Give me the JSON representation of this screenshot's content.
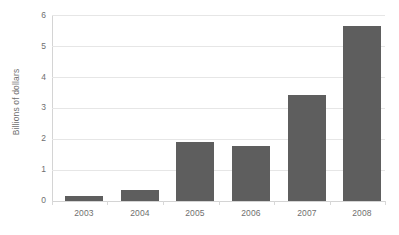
{
  "chart_data": {
    "type": "bar",
    "title": "",
    "subtitle": "",
    "xlabel": "",
    "ylabel": "Billions of dollars",
    "categories": [
      "2003",
      "2004",
      "2005",
      "2006",
      "2007",
      "2008"
    ],
    "values": [
      0.16,
      0.36,
      1.9,
      1.78,
      3.42,
      5.65
    ],
    "series": [
      {
        "name": "",
        "values": [
          0.16,
          0.36,
          1.9,
          1.78,
          3.42,
          5.65
        ],
        "color": "#5e5e5e"
      }
    ],
    "ylim": [
      0,
      6
    ],
    "xlim": null,
    "y_ticks": [
      "6",
      "5",
      "4",
      "3",
      "2",
      "1",
      "0"
    ],
    "y_tick_values": [
      6,
      5,
      4,
      3,
      2,
      1,
      0
    ],
    "grid": true,
    "grid_axis": "y",
    "legend": false,
    "legend_position": "none",
    "annotations": [],
    "data_labels": false
  },
  "style": {
    "background_color": "#ffffff",
    "bar_color": "#5e5e5e",
    "gridline_color": "#e6e6e6",
    "axis_color": "#d4d4d4",
    "text_color": "#6f6f6f"
  }
}
